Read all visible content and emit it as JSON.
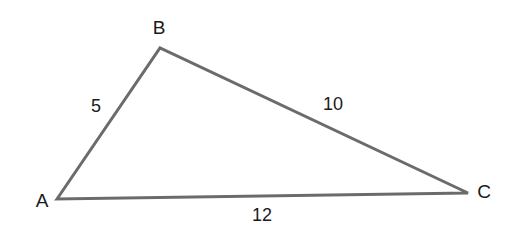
{
  "diagram": {
    "type": "triangle",
    "colors": {
      "stroke": "#6b6b6b",
      "text": "#1a1a1a",
      "background": "#ffffff"
    },
    "vertices": [
      {
        "name": "A",
        "x": 57,
        "y": 199,
        "label_x": 42,
        "label_y": 207
      },
      {
        "name": "B",
        "x": 160,
        "y": 48,
        "label_x": 159,
        "label_y": 34
      },
      {
        "name": "C",
        "x": 468,
        "y": 193,
        "label_x": 484,
        "label_y": 198
      }
    ],
    "sides": [
      {
        "between": "AB",
        "length": "5",
        "label_x": 96,
        "label_y": 112
      },
      {
        "between": "BC",
        "length": "10",
        "label_x": 333,
        "label_y": 110
      },
      {
        "between": "AC",
        "length": "12",
        "label_x": 262,
        "label_y": 221
      }
    ]
  }
}
